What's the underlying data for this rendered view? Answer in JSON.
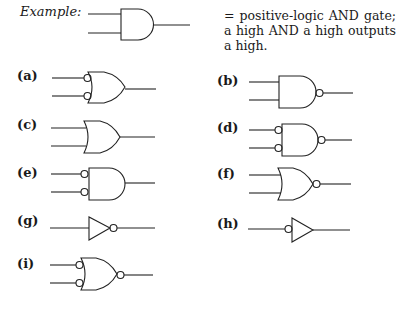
{
  "example": {
    "label": "Example:",
    "description": "= positive-logic AND gate; a high AND a high outputs a high."
  },
  "gates": [
    {
      "id": "a",
      "label": "(a)",
      "shape": "OR",
      "input_bubbles": true,
      "output_bubble": false
    },
    {
      "id": "b",
      "label": "(b)",
      "shape": "AND",
      "input_bubbles": false,
      "output_bubble": true
    },
    {
      "id": "c",
      "label": "(c)",
      "shape": "OR",
      "input_bubbles": false,
      "output_bubble": false
    },
    {
      "id": "d",
      "label": "(d)",
      "shape": "AND",
      "input_bubbles": true,
      "output_bubble": true
    },
    {
      "id": "e",
      "label": "(e)",
      "shape": "AND",
      "input_bubbles": true,
      "output_bubble": false
    },
    {
      "id": "f",
      "label": "(f)",
      "shape": "OR",
      "input_bubbles": false,
      "output_bubble": true
    },
    {
      "id": "g",
      "label": "(g)",
      "shape": "BUFFER",
      "input_bubbles": false,
      "output_bubble": true
    },
    {
      "id": "h",
      "label": "(h)",
      "shape": "BUFFER",
      "input_bubbles": true,
      "output_bubble": false
    },
    {
      "id": "i",
      "label": "(i)",
      "shape": "OR",
      "input_bubbles": true,
      "output_bubble": true
    }
  ]
}
